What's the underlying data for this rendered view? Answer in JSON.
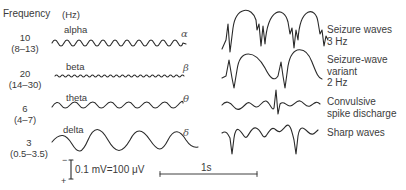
{
  "header": {
    "frequency_label": "Frequency",
    "unit_label": "(Hz)"
  },
  "normal_rhythms": [
    {
      "name": "alpha",
      "symbol": "α",
      "frequency": "10",
      "range": "(8–13)"
    },
    {
      "name": "beta",
      "symbol": "β",
      "frequency": "20",
      "range": "(14–30)"
    },
    {
      "name": "theta",
      "symbol": "θ",
      "frequency": "6",
      "range": "(4–7)"
    },
    {
      "name": "delta",
      "symbol": "δ",
      "frequency": "3",
      "range": "(0.5–3.5)"
    }
  ],
  "abnormal_patterns": [
    {
      "line1": "Seizure waves",
      "line2": "3 Hz",
      "line3": ""
    },
    {
      "line1": "Seizure-wave",
      "line2": "variant",
      "line3": "2 Hz"
    },
    {
      "line1": "Convulsive",
      "line2": "spike discharge",
      "line3": ""
    },
    {
      "line1": "Sharp waves",
      "line2": "",
      "line3": ""
    }
  ],
  "scale": {
    "minus": "−",
    "plus": "+",
    "voltage_label": "0.1 mV=100 μV",
    "time_label": "1s"
  },
  "colors": {
    "trace": "#2a2a2a",
    "text": "#3a3a3a"
  }
}
